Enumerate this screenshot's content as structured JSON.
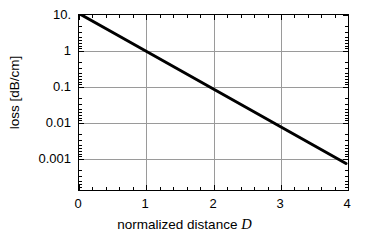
{
  "chart_data": {
    "type": "line",
    "title": "",
    "xlabel": "normalized distance D",
    "xlabel_plain": "normalized distance",
    "xlabel_italic": "D",
    "ylabel": "loss [dB/cm]",
    "yscale": "log",
    "xscale": "linear",
    "xlim": [
      0,
      4
    ],
    "ylim": [
      0.0002,
      12
    ],
    "grid": true,
    "legend": false,
    "xticks": [
      {
        "value": 0,
        "label": "0"
      },
      {
        "value": 1,
        "label": "1"
      },
      {
        "value": 2,
        "label": "2"
      },
      {
        "value": 3,
        "label": "3"
      },
      {
        "value": 4,
        "label": "4"
      }
    ],
    "yticks": [
      {
        "value": 10,
        "label": "10."
      },
      {
        "value": 1,
        "label": "1"
      },
      {
        "value": 0.1,
        "label": "0.1"
      },
      {
        "value": 0.01,
        "label": "0.01"
      },
      {
        "value": 0.001,
        "label": "0.001"
      }
    ],
    "series": [
      {
        "name": "loss",
        "color": "#000000",
        "linewidth": 3,
        "x": [
          0,
          0.5,
          1,
          1.5,
          2,
          2.5,
          3,
          3.5,
          4
        ],
        "y": [
          11.0,
          3.27,
          0.97,
          0.289,
          0.086,
          0.0255,
          0.0076,
          0.00226,
          0.00067
        ]
      }
    ]
  },
  "axes": {
    "x_title_plain": "normalized distance",
    "x_title_italic": "D",
    "y_title": "loss [dB/cm]"
  }
}
